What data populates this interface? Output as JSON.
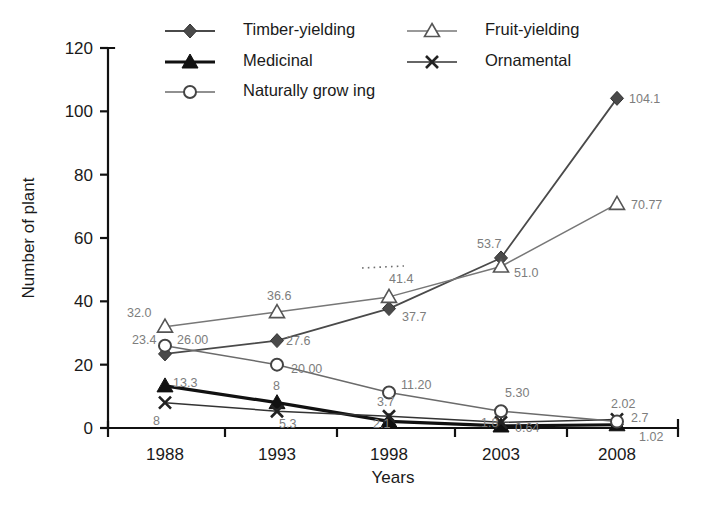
{
  "chart_data": {
    "type": "line",
    "title": "",
    "xlabel": "Years",
    "ylabel": "Number of plant",
    "categories": [
      "1988",
      "1993",
      "1998",
      "2003",
      "2008"
    ],
    "x": [
      1988,
      1993,
      1998,
      2003,
      2008
    ],
    "ylim": [
      0,
      120
    ],
    "yticks": [
      0,
      20,
      40,
      60,
      80,
      100,
      120
    ],
    "grid": false,
    "legend_position": "top",
    "annotations": [
      "dotted segment above the 41.4 label at 1998"
    ],
    "series": [
      {
        "name": "Timber-yielding",
        "marker": "filled-diamond",
        "color": "#4a4a4a",
        "values": [
          23.4,
          27.6,
          37.7,
          53.7,
          104.1
        ],
        "labels": [
          "23.4",
          "27.6",
          "37.7",
          "53.7",
          "104.1"
        ]
      },
      {
        "name": "Fruit-yielding",
        "marker": "open-triangle",
        "color": "#777777",
        "values": [
          32.0,
          36.6,
          41.4,
          51.0,
          70.77
        ],
        "labels": [
          "32.0",
          "36.6",
          "41.4",
          "51.0",
          "70.77"
        ]
      },
      {
        "name": "Medicinal",
        "marker": "filled-triangle",
        "color": "#111111",
        "values": [
          13.3,
          8,
          2.1,
          0.64,
          1.02
        ],
        "labels": [
          "13.3",
          "8",
          "2.1",
          "0.64",
          "1.02"
        ]
      },
      {
        "name": "Ornamental",
        "marker": "cross-x",
        "color": "#333333",
        "values": [
          8,
          5.3,
          3.7,
          1.8,
          2.7
        ],
        "labels": [
          "8",
          "5.3",
          "3.7",
          "1.8",
          "2.7"
        ]
      },
      {
        "name": "Naturally grow ing",
        "marker": "open-circle",
        "color": "#6b6b6b",
        "values": [
          26.0,
          20.0,
          11.2,
          5.3,
          2.02
        ],
        "labels": [
          "26.00",
          "20.00",
          "11.20",
          "5.30",
          "2.02"
        ]
      }
    ]
  },
  "legend": {
    "entries": [
      {
        "label": "Timber-yielding"
      },
      {
        "label": "Fruit-yielding"
      },
      {
        "label": "Medicinal"
      },
      {
        "label": "Ornamental"
      },
      {
        "label": "Naturally grow ing"
      }
    ]
  },
  "axes": {
    "y": {
      "title": "Number of plant",
      "ticks": [
        "120",
        "100",
        "80",
        "60",
        "40",
        "20",
        "0"
      ]
    },
    "x": {
      "title": "Years",
      "ticks": [
        "1988",
        "1993",
        "1998",
        "2003",
        "2008"
      ]
    }
  }
}
